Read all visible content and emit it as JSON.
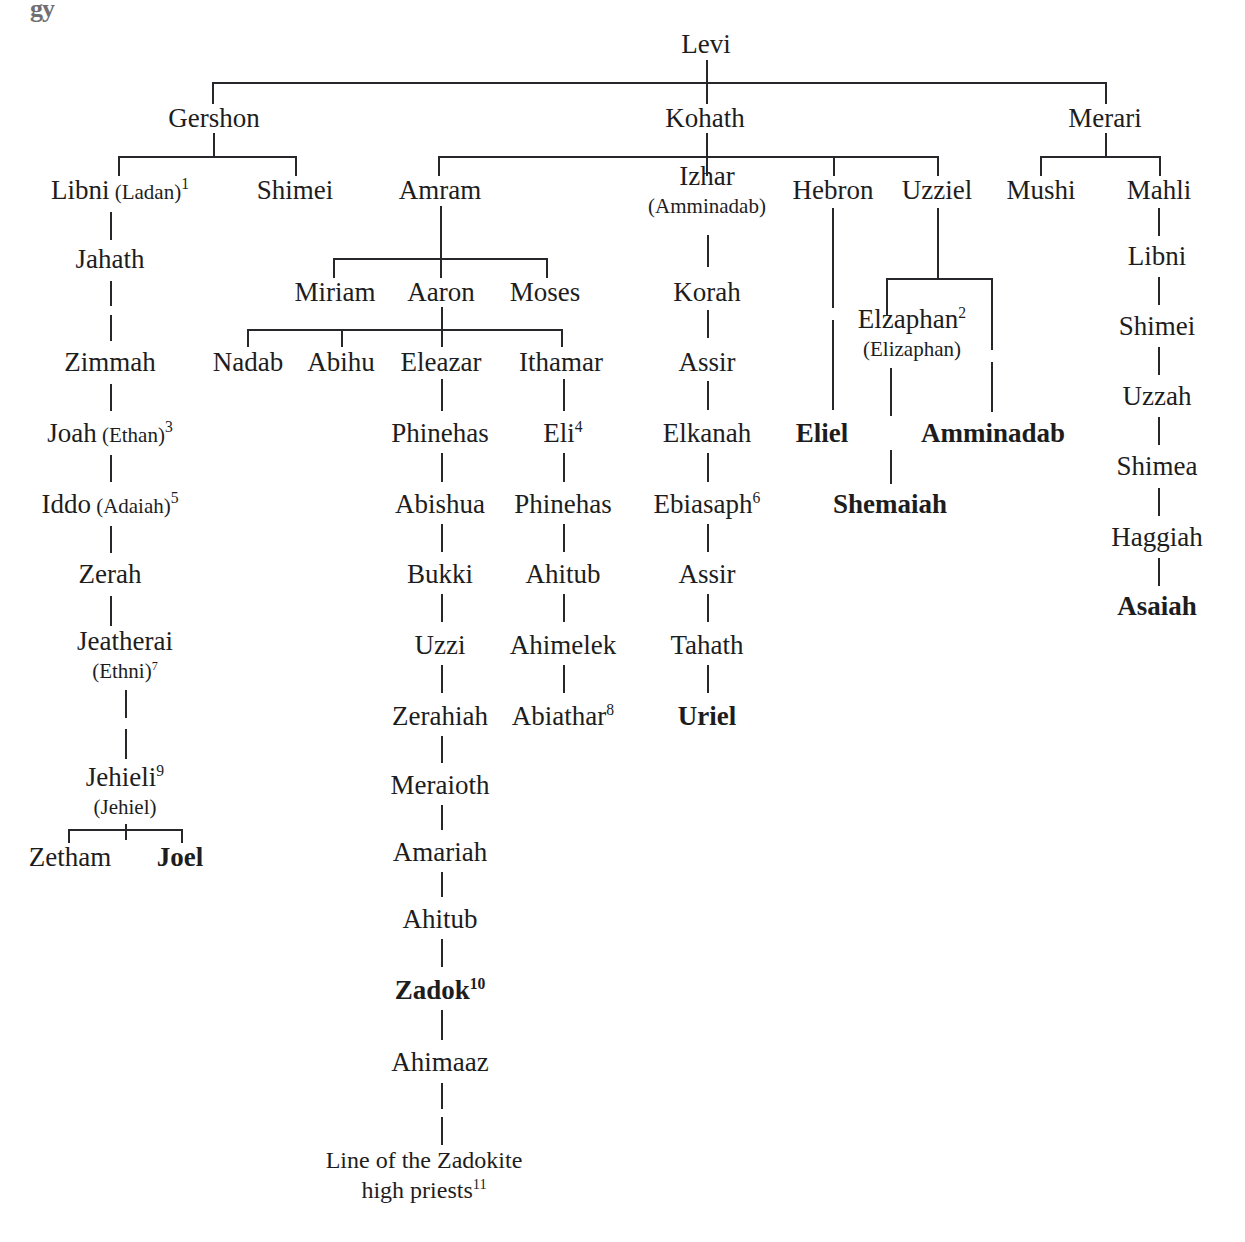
{
  "chart_title": "Genealogy of Levi",
  "scan_artifact": "gy",
  "root": {
    "label": "Levi",
    "x": 706,
    "y": 44
  },
  "levi_children": [
    {
      "label": "Gershon",
      "x": 214,
      "y": 118
    },
    {
      "label": "Kohath",
      "x": 705,
      "y": 118
    },
    {
      "label": "Merari",
      "x": 1105,
      "y": 118
    }
  ],
  "gershon_line": [
    {
      "label": "Libni",
      "alt": "(Ladan)",
      "sup": "1",
      "x": 120,
      "y": 190
    },
    {
      "label": "Shimei",
      "x": 295,
      "y": 190
    },
    {
      "label": "Jahath",
      "x": 110,
      "y": 259
    },
    {
      "label": "Zimmah",
      "x": 110,
      "y": 362
    },
    {
      "label": "Joah",
      "alt": "(Ethan)",
      "sup": "3",
      "x": 110,
      "y": 433
    },
    {
      "label": "Iddo",
      "alt": "(Adaiah)",
      "sup": "5",
      "x": 110,
      "y": 504
    },
    {
      "label": "Zerah",
      "x": 110,
      "y": 574
    },
    {
      "label": "Jeatherai",
      "altline": "(Ethni)",
      "sup2": "7",
      "x": 125,
      "y": 655
    },
    {
      "label": "Jehieli",
      "sup": "9",
      "altline": "(Jehiel)",
      "x": 125,
      "y": 791
    },
    {
      "label": "Zetham",
      "x": 70,
      "y": 857
    },
    {
      "label": "Joel",
      "bold": true,
      "x": 180,
      "y": 857
    }
  ],
  "kohath_children": [
    {
      "label": "Amram",
      "x": 440,
      "y": 190
    },
    {
      "label": "Izhar",
      "altline": "(Amminadab)",
      "x": 707,
      "y": 190
    },
    {
      "label": "Hebron",
      "x": 833,
      "y": 190
    },
    {
      "label": "Uzziel",
      "x": 937,
      "y": 190
    }
  ],
  "amram_children": [
    {
      "label": "Miriam",
      "x": 335,
      "y": 292
    },
    {
      "label": "Aaron",
      "x": 441,
      "y": 292
    },
    {
      "label": "Moses",
      "x": 545,
      "y": 292
    }
  ],
  "aaron_children": [
    {
      "label": "Nadab",
      "x": 248,
      "y": 362
    },
    {
      "label": "Abihu",
      "x": 341,
      "y": 362
    },
    {
      "label": "Eleazar",
      "x": 441,
      "y": 362
    },
    {
      "label": "Ithamar",
      "x": 561,
      "y": 362
    }
  ],
  "eleazar_line": [
    {
      "label": "Phinehas",
      "x": 440,
      "y": 433
    },
    {
      "label": "Abishua",
      "x": 440,
      "y": 504
    },
    {
      "label": "Bukki",
      "x": 440,
      "y": 574
    },
    {
      "label": "Uzzi",
      "x": 440,
      "y": 645
    },
    {
      "label": "Zerahiah",
      "x": 440,
      "y": 716
    },
    {
      "label": "Meraioth",
      "x": 440,
      "y": 785
    },
    {
      "label": "Amariah",
      "x": 440,
      "y": 852
    },
    {
      "label": "Ahitub",
      "x": 440,
      "y": 919
    },
    {
      "label": "Zadok",
      "sup": "10",
      "bold": true,
      "x": 440,
      "y": 990
    },
    {
      "label": "Ahimaaz",
      "x": 440,
      "y": 1062
    }
  ],
  "zadokite_terminal": {
    "line1": "Line of the Zadokite",
    "line2": "high priests",
    "sup": "11",
    "x": 424,
    "y": 1175
  },
  "ithamar_line": [
    {
      "label": "Eli",
      "sup": "4",
      "x": 563,
      "y": 433
    },
    {
      "label": "Phinehas",
      "x": 563,
      "y": 504
    },
    {
      "label": "Ahitub",
      "x": 563,
      "y": 574
    },
    {
      "label": "Ahimelek",
      "x": 563,
      "y": 645
    },
    {
      "label": "Abiathar",
      "sup": "8",
      "x": 563,
      "y": 716
    }
  ],
  "izhar_line": [
    {
      "label": "Korah",
      "x": 707,
      "y": 292
    },
    {
      "label": "Assir",
      "x": 707,
      "y": 362
    },
    {
      "label": "Elkanah",
      "x": 707,
      "y": 433
    },
    {
      "label": "Ebiasaph",
      "sup": "6",
      "x": 707,
      "y": 504
    },
    {
      "label": "Assir",
      "x": 707,
      "y": 574
    },
    {
      "label": "Tahath",
      "x": 707,
      "y": 645
    },
    {
      "label": "Uriel",
      "bold": true,
      "x": 707,
      "y": 716
    }
  ],
  "hebron_line": [
    {
      "label": "Eliel",
      "bold": true,
      "x": 822,
      "y": 433
    }
  ],
  "uzziel_children": [
    {
      "label": "Elzaphan",
      "sup": "2",
      "altline": "(Elizaphan)",
      "x": 912,
      "y": 333
    },
    {
      "label": "Amminadab",
      "bold": true,
      "x": 993,
      "y": 433
    }
  ],
  "elzaphan_line": [
    {
      "label": "Shemaiah",
      "bold": true,
      "x": 890,
      "y": 504
    }
  ],
  "merari_children": [
    {
      "label": "Mushi",
      "x": 1041,
      "y": 190
    },
    {
      "label": "Mahli",
      "x": 1159,
      "y": 190
    }
  ],
  "mahli_line": [
    {
      "label": "Libni",
      "x": 1157,
      "y": 256
    },
    {
      "label": "Shimei",
      "x": 1157,
      "y": 326
    },
    {
      "label": "Uzzah",
      "x": 1157,
      "y": 396
    },
    {
      "label": "Shimea",
      "x": 1157,
      "y": 466
    },
    {
      "label": "Haggiah",
      "x": 1157,
      "y": 537
    },
    {
      "label": "Asaiah",
      "bold": true,
      "x": 1157,
      "y": 606
    }
  ],
  "colors": {
    "ink": "#1d1d1d",
    "rule": "#26262b",
    "paper": "#ffffff"
  }
}
